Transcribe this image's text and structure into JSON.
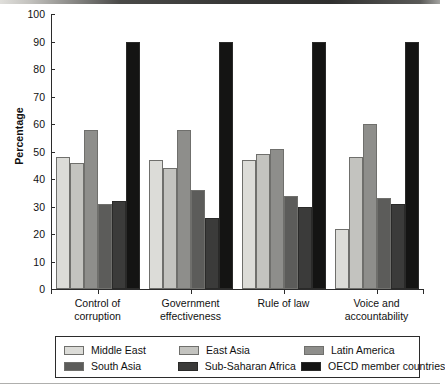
{
  "chart_data": {
    "type": "bar",
    "title": "",
    "xlabel": "",
    "ylabel": "Percentage",
    "ylim": [
      0,
      100
    ],
    "yticks": [
      0,
      10,
      20,
      30,
      40,
      50,
      60,
      70,
      80,
      90,
      100
    ],
    "grid": false,
    "legend_position": "bottom",
    "categories": [
      "Control of\ncorruption",
      "Government\neffectiveness",
      "Rule of law",
      "Voice and\naccountability"
    ],
    "series": [
      {
        "name": "Middle East",
        "color": "#dcdcd8",
        "values": [
          48,
          47,
          47,
          22
        ]
      },
      {
        "name": "East Asia",
        "color": "#c3c3bf",
        "values": [
          46,
          44,
          49,
          48
        ]
      },
      {
        "name": "Latin America",
        "color": "#8e8e8b",
        "values": [
          58,
          58,
          51,
          60
        ]
      },
      {
        "name": "South Asia",
        "color": "#5c5c5a",
        "values": [
          31,
          36,
          34,
          33
        ]
      },
      {
        "name": "Sub-Saharan Africa",
        "color": "#3b3b3a",
        "values": [
          32,
          26,
          30,
          31
        ]
      },
      {
        "name": "OECD member countries",
        "color": "#141413",
        "values": [
          90,
          90,
          90,
          90
        ]
      }
    ]
  }
}
